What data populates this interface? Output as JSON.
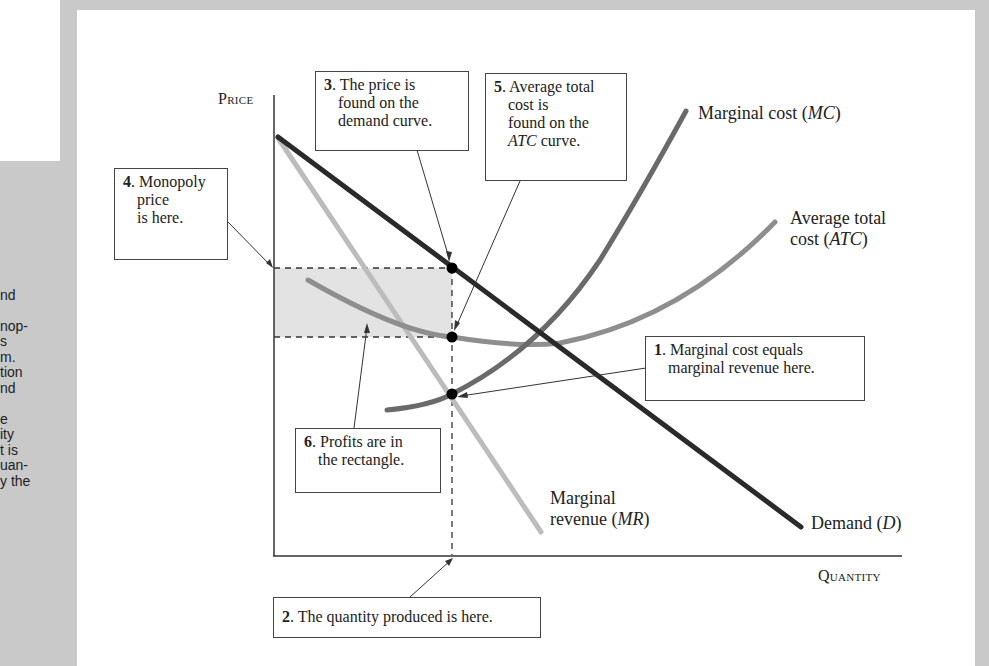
{
  "side_text": {
    "lines": [
      "",
      "nd",
      "",
      "nop-",
      "s",
      "m.",
      "tion",
      "nd",
      "",
      "e",
      "ity",
      "t is",
      "uan-",
      "y the"
    ]
  },
  "axes": {
    "y_label": "Price",
    "x_label": "Quantity"
  },
  "curves": {
    "mc_label_text": "Marginal cost (",
    "mc_label_abbr": "MC",
    "atc_label_line1": "Average total",
    "atc_label_line2_text": "cost (",
    "atc_label_abbr": "ATC",
    "mr_label_line1": "Marginal",
    "mr_label_line2_text": "revenue (",
    "mr_label_abbr": "MR",
    "demand_label_text": "Demand (",
    "demand_label_abbr": "D",
    "close_paren": ")"
  },
  "annotations": {
    "a1": {
      "num": "1",
      "line1": ". Marginal cost equals",
      "line2": "marginal revenue here."
    },
    "a2": {
      "num": "2",
      "line1": ". The quantity produced is here."
    },
    "a3": {
      "num": "3",
      "line1": ". The price is",
      "line2": "found on the",
      "line3": "demand curve."
    },
    "a4": {
      "num": "4",
      "line1": ". Monopoly",
      "line2": "price",
      "line3": "is here."
    },
    "a5": {
      "num": "5",
      "line1": ". Average total",
      "line2": "cost is",
      "line3": "found on the",
      "line4_abbr": "ATC",
      "line4_text": " curve."
    },
    "a6": {
      "num": "6",
      "line1": ". Profits are in",
      "line2": "the rectangle."
    }
  },
  "colors": {
    "demand": "#2a2a2a",
    "marginal_revenue": "#b9b9b9",
    "marginal_cost": "#6a6a6a",
    "average_total_cost": "#8e8e8e",
    "profit_rectangle": "#e2e2e2",
    "page_background": "#c9c9c9"
  },
  "chart_data": {
    "type": "line",
    "xlabel": "Quantity",
    "ylabel": "Price",
    "grid": false,
    "series": [
      {
        "name": "Demand (D)",
        "shape": "straight line, downward sloping",
        "points": [
          [
            0,
            10
          ],
          [
            9.6,
            0.6
          ]
        ]
      },
      {
        "name": "Marginal revenue (MR)",
        "shape": "straight line, steeper than demand",
        "points": [
          [
            0,
            10
          ],
          [
            4.8,
            0.5
          ]
        ]
      },
      {
        "name": "Marginal cost (MC)",
        "shape": "upward sloping curve",
        "points": [
          [
            2.0,
            3.6
          ],
          [
            3.2,
            4.0
          ],
          [
            5.0,
            6.5
          ],
          [
            7.5,
            11.0
          ]
        ]
      },
      {
        "name": "Average total cost (ATC)",
        "shape": "U-shaped curve",
        "points": [
          [
            0.6,
            6.7
          ],
          [
            3.2,
            5.4
          ],
          [
            4.8,
            5.1
          ],
          [
            9.2,
            8.2
          ]
        ]
      }
    ],
    "key_points": {
      "profit_max_quantity": "Q where MC = MR",
      "monopoly_price": "on demand curve at Q",
      "average_total_cost_at_Q": "on ATC curve at Q",
      "profit_area": "rectangle between price and ATC from 0 to Q"
    }
  }
}
